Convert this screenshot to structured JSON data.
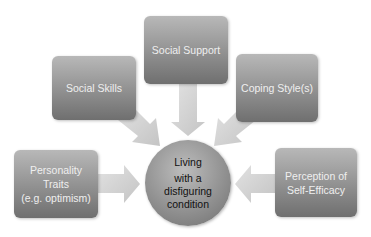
{
  "diagram": {
    "center": {
      "lines": [
        "Living",
        "with a",
        "disfiguring",
        "condition"
      ]
    },
    "factors": [
      {
        "id": "social-support",
        "lines": [
          "Social Support"
        ]
      },
      {
        "id": "social-skills",
        "lines": [
          "Social Skills"
        ]
      },
      {
        "id": "coping-style",
        "lines": [
          "Coping Style(s)"
        ]
      },
      {
        "id": "personality-traits",
        "lines": [
          "Personality",
          "Traits",
          "(e.g. optimism)"
        ]
      },
      {
        "id": "self-efficacy",
        "lines": [
          "Perception of",
          "Self-Efficacy"
        ]
      }
    ],
    "colors": {
      "box_top": "#b8b8b8",
      "box_bottom": "#6f6f6f",
      "arrow": "#d0d0d0",
      "box_text": "#efefef",
      "center_text": "#111111"
    }
  }
}
